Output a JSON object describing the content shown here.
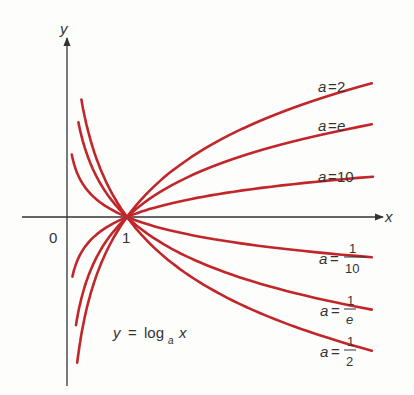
{
  "chart_data": {
    "type": "line",
    "title": "",
    "equation": {
      "lhs": "y",
      "eq": "=",
      "fn": "log",
      "sub": "a",
      "arg": "x"
    },
    "xlabel": "x",
    "ylabel": "y",
    "origin_label": "0",
    "tick_labels": [
      "1"
    ],
    "grid": false,
    "xlim": [
      0,
      5.1
    ],
    "ylim": [
      -2.95,
      3.0
    ],
    "curve_color": "#c0262a",
    "axis_color": "#333333",
    "series": [
      {
        "name": "a=2",
        "base": 2,
        "label": {
          "prefix": "a",
          "eq": "=",
          "value": "2"
        },
        "x_range": [
          0.17,
          5.08
        ]
      },
      {
        "name": "a=e",
        "base": 2.718,
        "label": {
          "prefix": "a",
          "eq": "=",
          "value": "e"
        },
        "x_range": [
          0.15,
          5.08
        ]
      },
      {
        "name": "a=10",
        "base": 10,
        "label": {
          "prefix": "a",
          "eq": "=",
          "value": "10"
        },
        "x_range": [
          0.09,
          5.1
        ]
      },
      {
        "name": "a=1/10",
        "base": 0.1,
        "label": {
          "prefix": "a",
          "eq": "=",
          "num": "1",
          "den": "10"
        },
        "x_range": [
          0.08,
          5.08
        ]
      },
      {
        "name": "a=1/e",
        "base": 0.3679,
        "label": {
          "prefix": "a",
          "eq": "=",
          "num": "1",
          "den": "e"
        },
        "x_range": [
          0.19,
          5.08
        ]
      },
      {
        "name": "a=1/2",
        "base": 0.5,
        "label": {
          "prefix": "a",
          "eq": "=",
          "num": "1",
          "den": "2"
        },
        "x_range": [
          0.24,
          5.08
        ]
      }
    ]
  }
}
